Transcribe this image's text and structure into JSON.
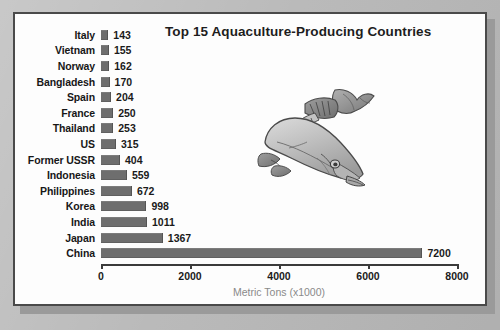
{
  "chart_data": {
    "type": "bar",
    "orientation": "horizontal",
    "title": "Top 15 Aquaculture-Producing Countries",
    "xlabel": "Metric Tons (x1000)",
    "ylabel": "",
    "categories": [
      "Italy",
      "Vietnam",
      "Norway",
      "Bangladesh",
      "Spain",
      "France",
      "Thailand",
      "US",
      "Former USSR",
      "Indonesia",
      "Philippines",
      "Korea",
      "India",
      "Japan",
      "China"
    ],
    "values": [
      143,
      155,
      162,
      170,
      204,
      250,
      253,
      315,
      404,
      559,
      672,
      998,
      1011,
      1367,
      7200
    ],
    "value_labels": [
      "143",
      "155",
      "162",
      "170",
      "204",
      "250",
      "253",
      "315",
      "404",
      "559",
      "672",
      "998",
      "1011",
      "1367",
      "7200"
    ],
    "xlim": [
      0,
      8000
    ],
    "xticks": [
      0,
      2000,
      4000,
      6000,
      8000
    ],
    "xtick_labels": [
      "0",
      "2000",
      "4000",
      "6000",
      "8000"
    ],
    "grid": false,
    "legend": null,
    "bar_color": "#6e6e6e",
    "background_color": "#fdfdfd",
    "text_color": "#1a1a1a",
    "axis_title_color": "#8a8a8a"
  },
  "artwork": {
    "fish_illustration": "salmon-fish-illustration"
  }
}
